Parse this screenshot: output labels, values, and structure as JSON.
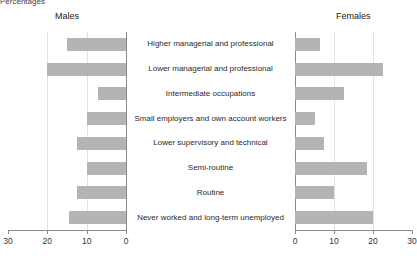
{
  "axis_unit_label": "Percentages",
  "panels": {
    "left_title": "Males",
    "right_title": "Females"
  },
  "colors": {
    "bar": "#b4b4b4",
    "axis": "#8a8a8a",
    "grid": "#e2e2e2",
    "text": "#333333"
  },
  "axis": {
    "left_ticks": [
      "30",
      "20",
      "10",
      "0"
    ],
    "right_ticks": [
      "0",
      "10",
      "20",
      "30"
    ],
    "max": 30
  },
  "chart_data": {
    "type": "bar",
    "orientation": "horizontal",
    "layout": "paired-pyramid",
    "title": "Percentages",
    "xlabel": "Percentages",
    "ylabel": "",
    "xlim": [
      0,
      30
    ],
    "grid": true,
    "legend": "none",
    "categories": [
      "Higher managerial and professional",
      "Lower managerial and professional",
      "Intermediate occupations",
      "Small employers and own account workers",
      "Lower supervisory and technical",
      "Semi-routine",
      "Routine",
      "Never worked and long-term unemployed"
    ],
    "series": [
      {
        "name": "Males",
        "side": "left",
        "values": [
          15,
          20,
          7,
          10,
          12.5,
          10,
          12.5,
          14.5
        ]
      },
      {
        "name": "Females",
        "side": "right",
        "values": [
          6.5,
          22.5,
          12.5,
          5,
          7.5,
          18.5,
          10,
          20
        ]
      }
    ]
  }
}
